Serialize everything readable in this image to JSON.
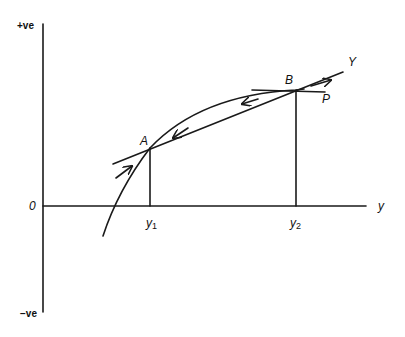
{
  "diagram": {
    "axes": {
      "y_top_label": "+ve",
      "origin_label": "0",
      "y_bottom_label": "−ve",
      "x_label": "y"
    },
    "points": {
      "a": {
        "label": "A"
      },
      "b": {
        "label": "B"
      }
    },
    "lines": {
      "chord_label": "Y",
      "tangent_label": "P"
    },
    "x_ticks": {
      "y1": {
        "base": "y",
        "sub": "1"
      },
      "y2": {
        "base": "y",
        "sub": "2"
      }
    },
    "colors": {
      "ink": "#1a1a1a",
      "background": "#ffffff"
    }
  }
}
